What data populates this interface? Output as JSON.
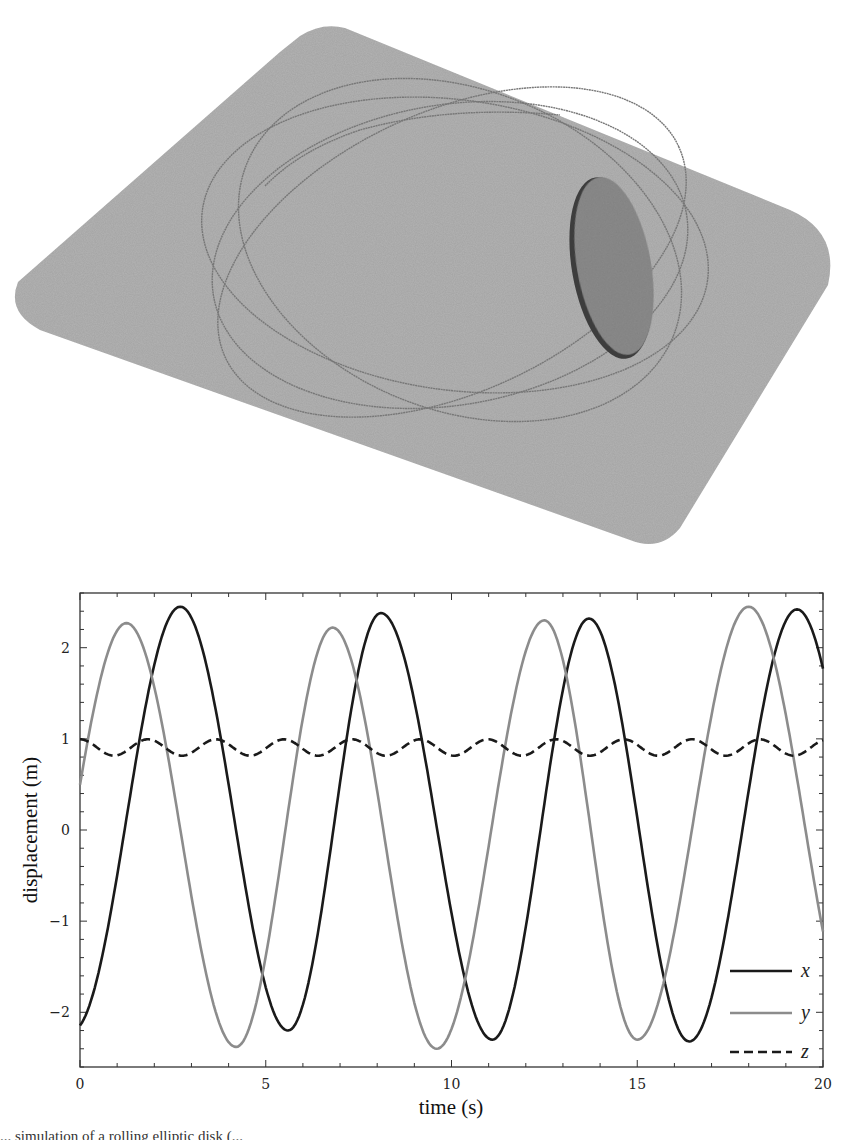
{
  "figure": {
    "scene": {
      "description": "3D rendering of a tilted elliptical disk rolling on a rounded square plane, with its traced contact path",
      "plane_color": "#b3b3b3",
      "path_color": "#7a7a7a",
      "disk_color": "#8a8a8a",
      "disk_edge_color": "#3a3a3a"
    },
    "caption_fragment": "... simulation of a rolling elliptic disk (..."
  },
  "chart_data": {
    "type": "line",
    "title": "",
    "xlabel": "time (s)",
    "ylabel": "displacement (m)",
    "xlim": [
      0,
      20
    ],
    "ylim": [
      -2.6,
      2.6
    ],
    "xticks": [
      0,
      5,
      10,
      15,
      20
    ],
    "xtick_labels": [
      "0",
      "5",
      "10",
      "15",
      "20"
    ],
    "yticks": [
      -2,
      -1,
      0,
      1,
      2
    ],
    "ytick_labels": [
      "−2",
      "−1",
      "0",
      "1",
      "2"
    ],
    "minor_x_step": 1,
    "minor_y_step": 0.2,
    "grid": false,
    "legend_position": "lower right",
    "series": [
      {
        "name": "x",
        "color": "#1a1a1a",
        "dash": "solid",
        "keypoints": [
          [
            0,
            -2.13
          ],
          [
            2.7,
            2.45
          ],
          [
            5.6,
            -2.2
          ],
          [
            8.1,
            2.38
          ],
          [
            11.1,
            -2.3
          ],
          [
            13.7,
            2.32
          ],
          [
            16.4,
            -2.32
          ],
          [
            19.3,
            2.42
          ],
          [
            20,
            1.85
          ]
        ]
      },
      {
        "name": "y",
        "color": "#8c8c8c",
        "dash": "solid",
        "keypoints": [
          [
            0,
            0.0
          ],
          [
            1.25,
            2.27
          ],
          [
            4.2,
            -2.38
          ],
          [
            6.8,
            2.22
          ],
          [
            9.6,
            -2.4
          ],
          [
            12.5,
            2.3
          ],
          [
            15.0,
            -2.3
          ],
          [
            18.0,
            2.45
          ],
          [
            20,
            -1.55
          ]
        ]
      },
      {
        "name": "z",
        "color": "#1a1a1a",
        "dash": "dashed",
        "mean": 0.905,
        "amplitude": 0.09,
        "period": 1.83,
        "phase_peak_t": 0.0,
        "min": 0.82,
        "max": 1.0
      }
    ],
    "legend": [
      {
        "label": "x",
        "style": "solid-black"
      },
      {
        "label": "y",
        "style": "solid-gray"
      },
      {
        "label": "z",
        "style": "dashed-black"
      }
    ]
  }
}
